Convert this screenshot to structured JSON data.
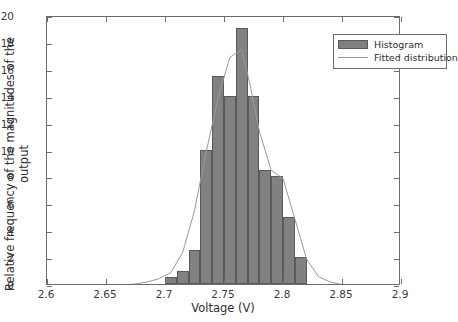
{
  "chart_data": {
    "type": "bar",
    "title": "",
    "xlabel": "Voltage (V)",
    "ylabel": "Relative frequency of the magnitudes of the output",
    "xlim": [
      2.6,
      2.9
    ],
    "ylim": [
      0,
      20
    ],
    "xticks": [
      2.6,
      2.65,
      2.7,
      2.75,
      2.8,
      2.85,
      2.9
    ],
    "xtick_labels": [
      "2.6",
      "2.65",
      "2.7",
      "2.75",
      "2.8",
      "2.85",
      "2.9"
    ],
    "yticks": [
      0,
      2,
      4,
      6,
      8,
      10,
      12,
      14,
      16,
      18,
      20
    ],
    "ytick_labels": [
      "0",
      "2",
      "4",
      "6",
      "8",
      "10",
      "12",
      "14",
      "16",
      "18",
      "20"
    ],
    "grid": false,
    "bin_width": 0.01,
    "bin_edges": [
      2.7,
      2.71,
      2.72,
      2.73,
      2.74,
      2.75,
      2.76,
      2.77,
      2.78,
      2.79,
      2.8,
      2.81,
      2.82
    ],
    "categories": [
      "2.70-2.71",
      "2.71-2.72",
      "2.72-2.73",
      "2.73-2.74",
      "2.74-2.75",
      "2.75-2.76",
      "2.76-2.77",
      "2.77-2.78",
      "2.78-2.79",
      "2.79-2.80",
      "2.80-2.81",
      "2.81-2.82"
    ],
    "values": [
      0.5,
      1,
      2.5,
      10,
      15.5,
      14,
      19,
      14,
      8.5,
      8,
      5,
      2
    ],
    "fitted_curve": {
      "name": "Fitted distribution",
      "x": [
        2.6,
        2.64,
        2.66,
        2.675,
        2.685,
        2.695,
        2.705,
        2.715,
        2.725,
        2.735,
        2.745,
        2.755,
        2.765,
        2.772,
        2.78,
        2.79,
        2.8,
        2.81,
        2.82,
        2.83,
        2.84,
        2.85,
        2.87,
        2.9
      ],
      "y": [
        0.0,
        0.0,
        0.05,
        0.15,
        0.3,
        0.55,
        1.0,
        2.5,
        5.6,
        10.0,
        14.0,
        17.0,
        17.6,
        15.0,
        11.5,
        8.6,
        8.0,
        5.0,
        2.0,
        0.7,
        0.3,
        0.1,
        0.02,
        0.0
      ]
    },
    "legend": {
      "position": "top-right",
      "entries": [
        {
          "label": "Histogram",
          "marker": "filled-box",
          "color": "#818181"
        },
        {
          "label": "Fitted distribution",
          "marker": "line",
          "color": "#9a9a9a"
        }
      ]
    },
    "colors": {
      "bar_fill": "#818181",
      "bar_edge": "#5a5a5a",
      "curve": "#9a9a9a",
      "axis": "#6d6d6d",
      "text": "#2e2e2e"
    }
  }
}
